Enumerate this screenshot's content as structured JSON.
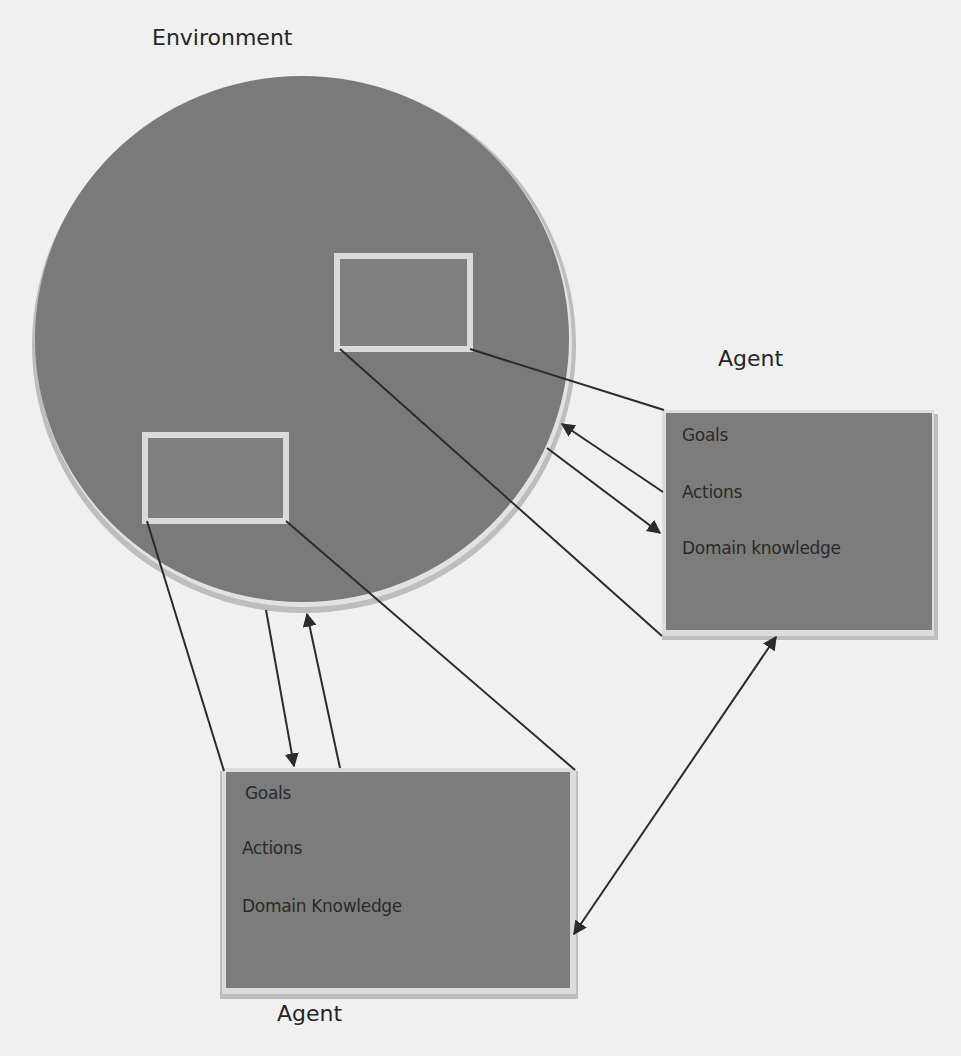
{
  "diagram": {
    "environment": {
      "label": "Environment",
      "fill": "#7a7a7a",
      "ring": "#d6d6d6",
      "inner_boxes": [
        {
          "name": "env-slot-upper-right"
        },
        {
          "name": "env-slot-lower-left"
        }
      ]
    },
    "agents": [
      {
        "label": "Agent",
        "items": [
          "Goals",
          "Actions",
          "Domain knowledge"
        ]
      },
      {
        "label": "Agent",
        "items": [
          "Goals",
          "Actions",
          "Domain Knowledge"
        ]
      }
    ],
    "colors": {
      "background": "#f0f0f0",
      "box_fill": "#7c7c7c",
      "box_border": "#d8d8d8",
      "line": "#2b2b2b",
      "text": "#262626"
    }
  }
}
